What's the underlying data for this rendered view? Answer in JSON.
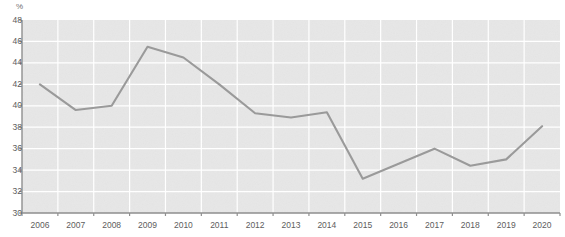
{
  "chart_data": {
    "type": "line",
    "title": "",
    "xlabel": "",
    "ylabel": "%",
    "ylim": [
      30,
      48
    ],
    "ytick_step": 2,
    "yticks": [
      48,
      46,
      44,
      42,
      40,
      38,
      36,
      34,
      32,
      30
    ],
    "grid": true,
    "legend": "none",
    "categories": [
      "2006",
      "2007",
      "2008",
      "2009",
      "2010",
      "2011",
      "2012",
      "2013",
      "2014",
      "2015",
      "2016",
      "2017",
      "2018",
      "2019",
      "2020"
    ],
    "values": [
      42.0,
      39.6,
      40.0,
      45.5,
      44.5,
      42.0,
      39.3,
      38.9,
      39.4,
      33.2,
      34.6,
      36.0,
      34.4,
      35.0,
      38.1
    ],
    "series": [
      {
        "name": "share",
        "color": "#9a9a9a",
        "values": [
          42.0,
          39.6,
          40.0,
          45.5,
          44.5,
          42.0,
          39.3,
          38.9,
          39.4,
          33.2,
          34.6,
          36.0,
          34.4,
          35.0,
          38.1
        ]
      }
    ]
  },
  "style": {
    "plot_background": "#e7e7e7",
    "grid_color": "#ffffff",
    "axis_color": "#8f8f8f",
    "line_color": "#9a9a9a",
    "tick_text_color": "#5d5d5d"
  }
}
